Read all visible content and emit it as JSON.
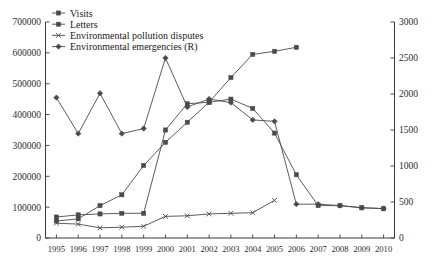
{
  "chart_data": {
    "type": "line",
    "title": "",
    "xlabel": "",
    "ylabel": "",
    "y2label": "",
    "grid": false,
    "legend_position": "top-left",
    "categories": [
      1995,
      1996,
      1997,
      1998,
      1999,
      2000,
      2001,
      2002,
      2003,
      2004,
      2005,
      2006,
      2007,
      2008,
      2009,
      2010
    ],
    "x_tick_labels": [
      "1995",
      "1996",
      "1997",
      "1998",
      "1999",
      "2000",
      "2001",
      "2002",
      "2003",
      "2004",
      "2005",
      "2006",
      "2007",
      "2008",
      "2009",
      "2010"
    ],
    "ylim": [
      0,
      700000
    ],
    "y_tick_labels": [
      "0",
      "100000",
      "200000",
      "300000",
      "400000",
      "500000",
      "600000",
      "700000"
    ],
    "y_ticks": [
      0,
      100000,
      200000,
      300000,
      400000,
      500000,
      600000,
      700000
    ],
    "y2lim": [
      0,
      3000
    ],
    "y2_tick_labels": [
      "0",
      "500",
      "1000",
      "1500",
      "2000",
      "2500",
      "3000"
    ],
    "y2_ticks": [
      0,
      500,
      1000,
      1500,
      2000,
      2500,
      3000
    ],
    "series": [
      {
        "name": "Visits",
        "axis": "left",
        "marker": "square",
        "values": [
          55000,
          62000,
          105000,
          140000,
          235000,
          310000,
          375000,
          440000,
          450000,
          420000,
          340000,
          205000,
          105000,
          105000,
          98000,
          95000
        ]
      },
      {
        "name": "Letters",
        "axis": "left",
        "marker": "square",
        "values": [
          68000,
          75000,
          78000,
          80000,
          80000,
          350000,
          435000,
          440000,
          520000,
          595000,
          605000,
          618000,
          null,
          null,
          null,
          null
        ]
      },
      {
        "name": "Environmental pollution disputes",
        "axis": "left",
        "marker": "cross",
        "values": [
          48000,
          45000,
          33000,
          35000,
          38000,
          70000,
          72000,
          78000,
          80000,
          82000,
          122000,
          null,
          null,
          null,
          null,
          null
        ]
      },
      {
        "name": "Environmental emergencies (R)",
        "axis": "right",
        "marker": "diamond",
        "values": [
          1950,
          1450,
          2010,
          1450,
          1520,
          2500,
          1820,
          1930,
          1880,
          1640,
          1620,
          470,
          470,
          450,
          420,
          410
        ]
      }
    ]
  },
  "legend": {
    "items": [
      {
        "label": "Visits"
      },
      {
        "label": "Letters"
      },
      {
        "label": "Environmental pollution disputes"
      },
      {
        "label": "Environmental emergencies (R)"
      }
    ]
  },
  "colors": {
    "line": "#4a4a4a",
    "axis": "#3a3a3a",
    "text": "#1a1a1a",
    "background": "#ffffff"
  }
}
